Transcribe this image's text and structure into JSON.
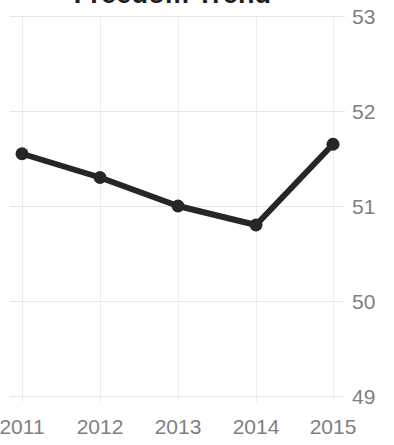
{
  "chart_data": {
    "type": "line",
    "title": "Freedom Trend",
    "xlabel": "",
    "ylabel": "",
    "categories": [
      "2011",
      "2012",
      "2013",
      "2014",
      "2015"
    ],
    "x": [
      2011,
      2012,
      2013,
      2014,
      2015
    ],
    "values": [
      51.55,
      51.3,
      51.0,
      50.8,
      51.65
    ],
    "series": [
      {
        "name": "Freedom Trend",
        "values": [
          51.55,
          51.3,
          51.0,
          50.8,
          51.65
        ]
      }
    ],
    "ylim": [
      49,
      53
    ],
    "yticks": [
      49,
      50,
      51,
      52,
      53
    ],
    "ytick_labels": [
      "49",
      "50",
      "51",
      "52",
      "53"
    ],
    "xtick_labels": [
      "2011",
      "2012",
      "2013",
      "2014",
      "2015"
    ],
    "grid": true,
    "legend": false,
    "legend_position": "none",
    "y_axis_side": "right",
    "marker": "circle",
    "colors": {
      "line": "#262626",
      "marker": "#262626",
      "gridline": "#e6e6e6",
      "tick_label": "#7f7f7f",
      "title": "#1d1d1d",
      "background": "#ffffff"
    }
  }
}
